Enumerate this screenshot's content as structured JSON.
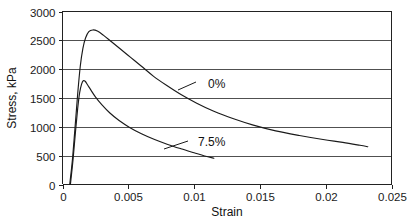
{
  "chart_data": {
    "type": "line",
    "title": "",
    "xlabel": "Strain",
    "ylabel": "Stress, kPa",
    "xlim": [
      0,
      0.025
    ],
    "ylim": [
      0,
      3000
    ],
    "xticks": [
      "0",
      "0.005",
      "0.01",
      "0.015",
      "0.02",
      "0.025"
    ],
    "xtick_values": [
      0,
      0.005,
      0.01,
      0.015,
      0.02,
      0.025
    ],
    "yticks": [
      "0",
      "500",
      "1000",
      "1500",
      "2000",
      "2500",
      "3000"
    ],
    "ytick_values": [
      0,
      500,
      1000,
      1500,
      2000,
      2500,
      3000
    ],
    "grid": "horizontal",
    "legend_position": "inline-annotations",
    "series": [
      {
        "name": "0%",
        "label": "0%",
        "annotation": "0%",
        "points": [
          [
            0.00055,
            0
          ],
          [
            0.00075,
            420
          ],
          [
            0.00095,
            980
          ],
          [
            0.00115,
            1560
          ],
          [
            0.00135,
            2050
          ],
          [
            0.00155,
            2360
          ],
          [
            0.00175,
            2540
          ],
          [
            0.002,
            2650
          ],
          [
            0.0023,
            2680
          ],
          [
            0.00265,
            2660
          ],
          [
            0.0031,
            2590
          ],
          [
            0.0037,
            2480
          ],
          [
            0.0044,
            2350
          ],
          [
            0.0052,
            2200
          ],
          [
            0.006,
            2050
          ],
          [
            0.0069,
            1880
          ],
          [
            0.0079,
            1720
          ],
          [
            0.009,
            1560
          ],
          [
            0.0102,
            1410
          ],
          [
            0.0115,
            1270
          ],
          [
            0.013,
            1140
          ],
          [
            0.0145,
            1030
          ],
          [
            0.0162,
            930
          ],
          [
            0.018,
            850
          ],
          [
            0.0198,
            780
          ],
          [
            0.0213,
            730
          ],
          [
            0.0226,
            680
          ],
          [
            0.0232,
            655
          ]
        ]
      },
      {
        "name": "7.5%",
        "label": "7.5%",
        "annotation": "7.5%",
        "points": [
          [
            0.0006,
            0
          ],
          [
            0.0008,
            430
          ],
          [
            0.00098,
            900
          ],
          [
            0.00115,
            1310
          ],
          [
            0.0013,
            1590
          ],
          [
            0.00145,
            1740
          ],
          [
            0.00158,
            1800
          ],
          [
            0.00172,
            1790
          ],
          [
            0.0019,
            1730
          ],
          [
            0.00215,
            1640
          ],
          [
            0.0025,
            1520
          ],
          [
            0.003,
            1380
          ],
          [
            0.0036,
            1240
          ],
          [
            0.0043,
            1110
          ],
          [
            0.0051,
            990
          ],
          [
            0.006,
            880
          ],
          [
            0.007,
            780
          ],
          [
            0.008,
            695
          ],
          [
            0.009,
            620
          ],
          [
            0.01,
            550
          ],
          [
            0.0108,
            495
          ],
          [
            0.0115,
            455
          ]
        ]
      }
    ],
    "annotations": [
      {
        "text": "0%",
        "text_x_px": 208,
        "text_y_px": 88,
        "leader": [
          [
            178,
            90
          ],
          [
            196,
            82
          ]
        ]
      },
      {
        "text": "7.5%",
        "text_x_px": 198,
        "text_y_px": 146,
        "leader": [
          [
            164,
            149
          ],
          [
            188,
            141
          ]
        ]
      }
    ]
  },
  "axes": {
    "x_axis_title": "Strain",
    "y_axis_title": "Stress, kPa"
  }
}
